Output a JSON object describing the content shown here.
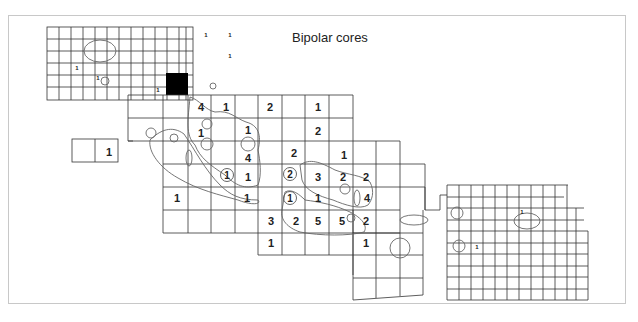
{
  "title": "Bipolar cores",
  "colors": {
    "line": "#333333",
    "contour": "#666666",
    "frame": "#c8c8c8",
    "filled_cell": "#000000"
  },
  "main_grid_counts": [
    {
      "x": 201,
      "y": 107,
      "v": "4"
    },
    {
      "x": 226,
      "y": 107,
      "v": "1"
    },
    {
      "x": 270,
      "y": 107,
      "v": "2"
    },
    {
      "x": 318,
      "y": 107,
      "v": "1"
    },
    {
      "x": 201,
      "y": 133,
      "v": "1"
    },
    {
      "x": 248,
      "y": 130,
      "v": "1"
    },
    {
      "x": 318,
      "y": 131,
      "v": "2"
    },
    {
      "x": 294,
      "y": 153,
      "v": "2"
    },
    {
      "x": 344,
      "y": 155,
      "v": "1"
    },
    {
      "x": 248,
      "y": 158,
      "v": "4"
    },
    {
      "x": 248,
      "y": 177,
      "v": "1"
    },
    {
      "x": 318,
      "y": 177,
      "v": "3"
    },
    {
      "x": 343,
      "y": 177,
      "v": "2"
    },
    {
      "x": 366,
      "y": 177,
      "v": "2"
    },
    {
      "x": 177,
      "y": 198,
      "v": "1"
    },
    {
      "x": 247,
      "y": 198,
      "v": "1"
    },
    {
      "x": 318,
      "y": 198,
      "v": "1"
    },
    {
      "x": 367,
      "y": 198,
      "v": "4"
    },
    {
      "x": 271,
      "y": 221,
      "v": "3"
    },
    {
      "x": 296,
      "y": 221,
      "v": "2"
    },
    {
      "x": 318,
      "y": 221,
      "v": "5"
    },
    {
      "x": 342,
      "y": 221,
      "v": "5"
    },
    {
      "x": 366,
      "y": 221,
      "v": "2"
    },
    {
      "x": 271,
      "y": 243,
      "v": "1"
    },
    {
      "x": 366,
      "y": 243,
      "v": "1"
    },
    {
      "x": 109,
      "y": 152,
      "v": "1"
    }
  ],
  "circled_counts": [
    {
      "x": 227,
      "y": 175,
      "v": "1"
    },
    {
      "x": 290,
      "y": 174,
      "v": "2"
    },
    {
      "x": 290,
      "y": 198,
      "v": "1"
    }
  ],
  "small_counts": [
    {
      "x": 206,
      "y": 35,
      "v": "1"
    },
    {
      "x": 230,
      "y": 35,
      "v": "1"
    },
    {
      "x": 230,
      "y": 56,
      "v": "1"
    },
    {
      "x": 77,
      "y": 68,
      "v": "1"
    },
    {
      "x": 98,
      "y": 78,
      "v": "1"
    },
    {
      "x": 158,
      "y": 90,
      "v": "1"
    },
    {
      "x": 522,
      "y": 212,
      "v": "1"
    },
    {
      "x": 477,
      "y": 247,
      "v": "1"
    }
  ]
}
